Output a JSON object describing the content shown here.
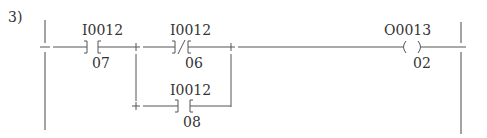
{
  "diagram": {
    "number": "3)",
    "type": "ladder-logic",
    "rung": {
      "contacts": [
        {
          "id": "c1",
          "type": "normally-open",
          "address": "I0012",
          "bit": "07"
        },
        {
          "id": "c2",
          "type": "normally-closed",
          "address": "I0012",
          "bit": "06"
        },
        {
          "id": "c3",
          "type": "normally-open",
          "address": "I0012",
          "bit": "08",
          "parallel_with": "c2"
        }
      ],
      "coil": {
        "type": "output-coil",
        "address": "O0013",
        "bit": "02"
      }
    }
  }
}
